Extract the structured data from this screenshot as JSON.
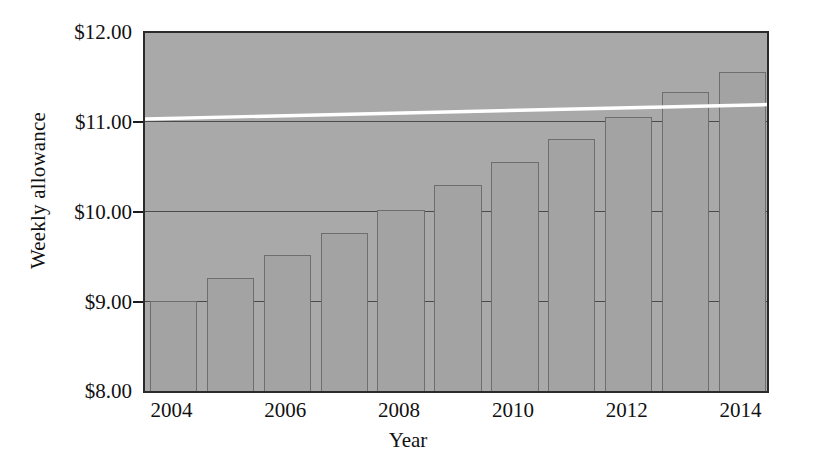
{
  "chart_data": {
    "type": "bar",
    "title": "",
    "subtitle": "",
    "xlabel": "Year",
    "ylabel": "Weekly allowance",
    "categories": [
      2004,
      2005,
      2006,
      2007,
      2008,
      2009,
      2010,
      2011,
      2012,
      2013,
      2014
    ],
    "values": [
      9.0,
      9.25,
      9.5,
      9.75,
      10.0,
      10.28,
      10.53,
      10.78,
      11.03,
      11.3,
      11.53
    ],
    "series": [
      {
        "name": "Weekly allowance",
        "values": [
          9.0,
          9.25,
          9.5,
          9.75,
          10.0,
          10.28,
          10.53,
          10.78,
          11.03,
          11.3,
          11.53
        ]
      }
    ],
    "ylim": [
      8.0,
      12.0
    ],
    "xlim": [
      2003.5,
      2014.5
    ],
    "ytick_labels": [
      "$12.00",
      "$11.00",
      "$10.00",
      "$9.00",
      "$8.00"
    ],
    "ytick_values": [
      12.0,
      11.0,
      10.0,
      9.0,
      8.0
    ],
    "xtick_labels": [
      "2004",
      "2006",
      "2008",
      "2010",
      "2012",
      "2014"
    ],
    "xtick_values": [
      2004,
      2006,
      2008,
      2010,
      2012,
      2014
    ],
    "grid": true,
    "legend": false,
    "legend_position": "none",
    "annotations": [
      {
        "type": "trendline",
        "color": "#ffffff",
        "y_start": 11.04,
        "y_end": 11.2,
        "label": ""
      }
    ],
    "colors": {
      "plot_background": "#a9a9a9",
      "bar_fill": "#a3a3a3",
      "bar_stroke": "#6e6e6e",
      "axis": "#2b2b2b",
      "gridline": "#4a4a4a",
      "text": "#111111",
      "page_background": "#ffffff",
      "trendline": "#ffffff"
    }
  }
}
